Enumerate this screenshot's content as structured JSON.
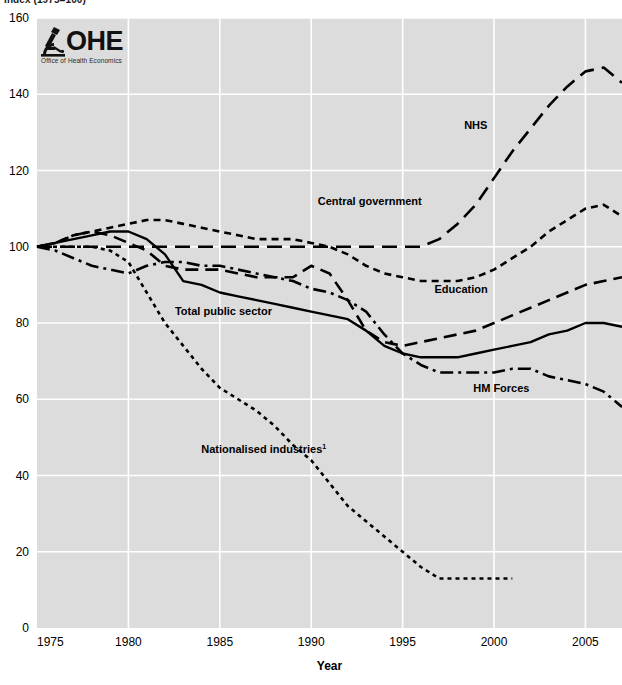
{
  "title_clipped": "Index (1975=100)",
  "logo": {
    "wordmark": "OHE",
    "subtitle": "Office of Health Economics",
    "icon": "microscope-icon"
  },
  "chart_data": {
    "type": "line",
    "title": "Index (1975=100)",
    "xlabel": "Year",
    "ylabel": "",
    "xlim": [
      1975,
      2007
    ],
    "ylim": [
      0,
      160
    ],
    "xticks": [
      1975,
      1980,
      1985,
      1990,
      1995,
      2000,
      2005
    ],
    "yticks": [
      0,
      20,
      40,
      60,
      80,
      100,
      120,
      140,
      160
    ],
    "grid": true,
    "legend": "inline-labels",
    "plot_background": "#dcdcdc",
    "gridline_color": "#ffffff",
    "line_color": "#000000",
    "footnote_marker": "1",
    "series": [
      {
        "name": "NHS",
        "dash": "long-dash",
        "label_x": 1999.0,
        "label_y": 131,
        "x": [
          1975,
          1976,
          1977,
          1978,
          1979,
          1980,
          1981,
          1982,
          1983,
          1984,
          1985,
          1986,
          1987,
          1988,
          1989,
          1990,
          1991,
          1992,
          1993,
          1994,
          1995,
          1996,
          1997,
          1998,
          1999,
          2000,
          2001,
          2002,
          2003,
          2004,
          2005,
          2006,
          2007
        ],
        "y": [
          100,
          100,
          100,
          100,
          100,
          100,
          100,
          100,
          100,
          100,
          100,
          100,
          100,
          100,
          100,
          100,
          100,
          100,
          100,
          100,
          100,
          100,
          102,
          106,
          111,
          118,
          125,
          131,
          137,
          142,
          146,
          147,
          143
        ]
      },
      {
        "name": "Central government",
        "dash": "short-dash",
        "label_x": 1993.2,
        "label_y": 111,
        "x": [
          1975,
          1976,
          1977,
          1978,
          1979,
          1980,
          1981,
          1982,
          1983,
          1984,
          1985,
          1986,
          1987,
          1988,
          1989,
          1990,
          1991,
          1992,
          1993,
          1994,
          1995,
          1996,
          1997,
          1998,
          1999,
          2000,
          2001,
          2002,
          2003,
          2004,
          2005,
          2006,
          2007
        ],
        "y": [
          100,
          101,
          103,
          104,
          105,
          106,
          107,
          107,
          106,
          105,
          104,
          103,
          102,
          102,
          102,
          101,
          100,
          98,
          95,
          93,
          92,
          91,
          91,
          91,
          92,
          94,
          97,
          100,
          104,
          107,
          110,
          111,
          108
        ]
      },
      {
        "name": "Education",
        "dash": "medium-dash",
        "label_x": 1998.2,
        "label_y": 88,
        "x": [
          1975,
          1976,
          1977,
          1978,
          1979,
          1980,
          1981,
          1982,
          1983,
          1984,
          1985,
          1986,
          1987,
          1988,
          1989,
          1990,
          1991,
          1992,
          1993,
          1994,
          1995,
          1996,
          1997,
          1998,
          1999,
          2000,
          2001,
          2002,
          2003,
          2004,
          2005,
          2006,
          2007
        ],
        "y": [
          100,
          101,
          103,
          104,
          103,
          101,
          99,
          95,
          94,
          94,
          94,
          93,
          92,
          92,
          92,
          95,
          93,
          86,
          78,
          75,
          74,
          75,
          76,
          77,
          78,
          80,
          82,
          84,
          86,
          88,
          90,
          91,
          92
        ]
      },
      {
        "name": "Total public sector",
        "dash": "solid",
        "label_x": 1985.2,
        "label_y": 82,
        "x": [
          1975,
          1976,
          1977,
          1978,
          1979,
          1980,
          1981,
          1982,
          1983,
          1984,
          1985,
          1986,
          1987,
          1988,
          1989,
          1990,
          1991,
          1992,
          1993,
          1994,
          1995,
          1996,
          1997,
          1998,
          1999,
          2000,
          2001,
          2002,
          2003,
          2004,
          2005,
          2006,
          2007
        ],
        "y": [
          100,
          101,
          102,
          103,
          104,
          104,
          102,
          98,
          91,
          90,
          88,
          87,
          86,
          85,
          84,
          83,
          82,
          81,
          78,
          74,
          72,
          71,
          71,
          71,
          72,
          73,
          74,
          75,
          77,
          78,
          80,
          80,
          79
        ]
      },
      {
        "name": "HM Forces",
        "dash": "dash-dot",
        "label_x": 2000.4,
        "label_y": 62,
        "x": [
          1975,
          1976,
          1977,
          1978,
          1979,
          1980,
          1981,
          1982,
          1983,
          1984,
          1985,
          1986,
          1987,
          1988,
          1989,
          1990,
          1991,
          1992,
          1993,
          1994,
          1995,
          1996,
          1997,
          1998,
          1999,
          2000,
          2001,
          2002,
          2003,
          2004,
          2005,
          2006,
          2007
        ],
        "y": [
          100,
          99,
          97,
          95,
          94,
          93,
          95,
          96,
          96,
          95,
          95,
          94,
          93,
          92,
          91,
          89,
          88,
          86,
          83,
          77,
          72,
          69,
          67,
          67,
          67,
          67,
          68,
          68,
          66,
          65,
          64,
          62,
          58
        ]
      },
      {
        "name": "Nationalised industries",
        "dash": "dot",
        "label_x": 1987.4,
        "label_y": 46,
        "x": [
          1975,
          1976,
          1977,
          1978,
          1979,
          1980,
          1981,
          1982,
          1983,
          1984,
          1985,
          1986,
          1987,
          1988,
          1989,
          1990,
          1991,
          1992,
          1993,
          1994,
          1995,
          1996,
          1997,
          1998,
          1999,
          2000,
          2001
        ],
        "y": [
          100,
          100,
          100,
          100,
          99,
          96,
          88,
          80,
          74,
          68,
          63,
          60,
          57,
          53,
          48,
          44,
          38,
          32,
          28,
          24,
          20,
          16,
          13,
          13,
          13,
          13,
          13
        ]
      }
    ]
  }
}
